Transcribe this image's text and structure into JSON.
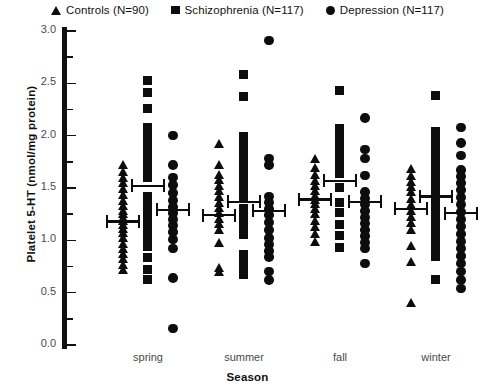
{
  "legend": {
    "entries": [
      {
        "label": "Controls (N=90)",
        "marker": "triangle-marker"
      },
      {
        "label": "Schizophrenia (N=117)",
        "marker": "square-marker"
      },
      {
        "label": "Depression (N=117)",
        "marker": "circle-marker"
      }
    ]
  },
  "chart_data": {
    "type": "scatter",
    "title": "",
    "xlabel": "Season",
    "ylabel": "Platelet 5-HT (nmol/mg protein)",
    "ylim": [
      0.0,
      3.0
    ],
    "yticks": [
      "0.0",
      "0.5",
      "1.0",
      "1.5",
      "2.0",
      "2.5",
      "3.0"
    ],
    "ytick_values": [
      0.0,
      0.5,
      1.0,
      1.5,
      2.0,
      2.5,
      3.0
    ],
    "yminor_step": 0.25,
    "grid": false,
    "legend_position": "top-center",
    "categories": [
      "spring",
      "summer",
      "fall",
      "winter"
    ],
    "series": [
      {
        "name": "Controls (N=90)",
        "marker": "triangle",
        "color": "#0d0d0d",
        "n": 90,
        "groups": [
          {
            "category": "spring",
            "mean": 1.19,
            "values": [
              1.72,
              1.66,
              1.6,
              1.55,
              1.49,
              1.44,
              1.38,
              1.33,
              1.28,
              1.25,
              1.22,
              1.19,
              1.15,
              1.11,
              1.07,
              1.02,
              0.97,
              0.92,
              0.87,
              0.82,
              0.77,
              0.72
            ]
          },
          {
            "category": "summer",
            "mean": 1.25,
            "values": [
              1.92,
              1.72,
              1.63,
              1.58,
              1.52,
              1.47,
              1.42,
              1.36,
              1.31,
              1.26,
              1.21,
              1.16,
              1.1,
              0.98,
              0.74,
              0.7
            ]
          },
          {
            "category": "fall",
            "mean": 1.4,
            "values": [
              1.78,
              1.69,
              1.63,
              1.57,
              1.52,
              1.47,
              1.43,
              1.39,
              1.35,
              1.3,
              1.25,
              1.19,
              1.13,
              1.06,
              0.99
            ]
          },
          {
            "category": "winter",
            "mean": 1.31,
            "values": [
              1.68,
              1.62,
              1.56,
              1.51,
              1.46,
              1.4,
              1.34,
              1.28,
              1.23,
              1.17,
              1.1,
              0.95,
              0.8,
              0.4
            ]
          }
        ]
      },
      {
        "name": "Schizophrenia (N=117)",
        "marker": "square",
        "color": "#0d0d0d",
        "n": 117,
        "groups": [
          {
            "category": "spring",
            "mean": 1.53,
            "values": [
              2.52,
              2.41,
              2.26,
              2.08,
              2.02,
              1.96,
              1.9,
              1.84,
              1.78,
              1.72,
              1.66,
              1.6,
              1.42,
              1.36,
              1.3,
              1.24,
              1.18,
              1.12,
              1.06,
              1.0,
              0.94,
              0.83,
              0.72,
              0.62
            ]
          },
          {
            "category": "summer",
            "mean": 1.38,
            "values": [
              2.58,
              2.37,
              1.99,
              1.9,
              1.84,
              1.78,
              1.72,
              1.66,
              1.58,
              1.52,
              1.46,
              1.4,
              1.3,
              1.24,
              1.18,
              1.12,
              1.05,
              0.86,
              0.79,
              0.73,
              0.67
            ]
          },
          {
            "category": "fall",
            "mean": 1.58,
            "values": [
              2.43,
              2.07,
              2.01,
              1.95,
              1.89,
              1.83,
              1.77,
              1.7,
              1.64,
              1.5,
              1.36,
              1.26,
              1.15,
              1.04,
              0.93
            ]
          },
          {
            "category": "winter",
            "mean": 1.43,
            "values": [
              2.38,
              2.04,
              1.97,
              1.9,
              1.83,
              1.76,
              1.7,
              1.64,
              1.58,
              1.52,
              1.46,
              1.4,
              1.34,
              1.26,
              1.19,
              1.12,
              1.05,
              0.98,
              0.91,
              0.84,
              0.62
            ]
          }
        ]
      },
      {
        "name": "Depression (N=117)",
        "marker": "circle",
        "color": "#0d0d0d",
        "n": 117,
        "groups": [
          {
            "category": "spring",
            "mean": 1.3,
            "values": [
              2.0,
              1.72,
              1.6,
              1.53,
              1.45,
              1.38,
              1.32,
              1.26,
              1.2,
              1.14,
              1.08,
              1.01,
              0.92,
              0.64,
              0.16
            ]
          },
          {
            "category": "summer",
            "mean": 1.29,
            "values": [
              2.91,
              1.78,
              1.72,
              1.42,
              1.36,
              1.3,
              1.24,
              1.17,
              1.1,
              1.02,
              0.96,
              0.9,
              0.84,
              0.7,
              0.62
            ]
          },
          {
            "category": "fall",
            "mean": 1.38,
            "values": [
              2.17,
              1.87,
              1.78,
              1.62,
              1.46,
              1.4,
              1.34,
              1.28,
              1.22,
              1.16,
              1.1,
              1.04,
              0.98,
              0.92,
              0.78
            ]
          },
          {
            "category": "winter",
            "mean": 1.27,
            "values": [
              2.08,
              1.93,
              1.81,
              1.67,
              1.61,
              1.55,
              1.48,
              1.41,
              1.34,
              1.27,
              1.2,
              1.13,
              1.06,
              0.99,
              0.92,
              0.85,
              0.78,
              0.7,
              0.62,
              0.54
            ]
          }
        ]
      }
    ]
  }
}
